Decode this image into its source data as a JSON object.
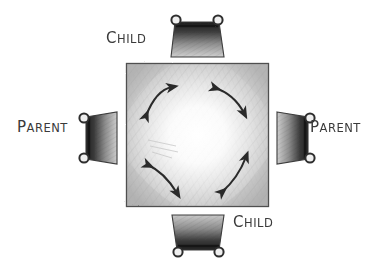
{
  "diagram": {
    "medium": "pencil sketch on white paper",
    "background_color": "#ffffff",
    "ink_color": "#3a3a3a",
    "table": {
      "shape": "square",
      "shading": "pencil hatching, darker at edges and corners, light in center",
      "fill_light": "#fdfdfd",
      "fill_dark": "#b9b9b9"
    },
    "labels": {
      "child_top": {
        "cap": "C",
        "rest": "HILD",
        "full": "CHILD"
      },
      "child_bottom": {
        "cap": "C",
        "rest": "HILD",
        "full": "CHILD"
      },
      "parent_left": {
        "cap": "P",
        "rest": "ARENT",
        "full": "PARENT"
      },
      "parent_right": {
        "cap": "P",
        "rest": "ARENT",
        "full": "PARENT"
      }
    },
    "seats": [
      {
        "name": "chair-top",
        "label": "CHILD",
        "position": "top",
        "orientation": "knobs-up"
      },
      {
        "name": "chair-bottom",
        "label": "CHILD",
        "position": "bottom",
        "orientation": "knobs-down"
      },
      {
        "name": "chair-left",
        "label": "PARENT",
        "position": "left",
        "orientation": "knobs-left"
      },
      {
        "name": "chair-right",
        "label": "PARENT",
        "position": "right",
        "orientation": "knobs-right"
      }
    ],
    "arrows": [
      {
        "name": "arrow-top-left",
        "style": "double-headed curved",
        "direction": "up-right / down-left"
      },
      {
        "name": "arrow-top-right",
        "style": "double-headed curved",
        "direction": "up-left / down-right"
      },
      {
        "name": "arrow-bottom-left",
        "style": "double-headed curved",
        "direction": "up-left / down-right"
      },
      {
        "name": "arrow-bottom-right",
        "style": "double-headed curved",
        "direction": "up-right / down-left"
      }
    ]
  }
}
